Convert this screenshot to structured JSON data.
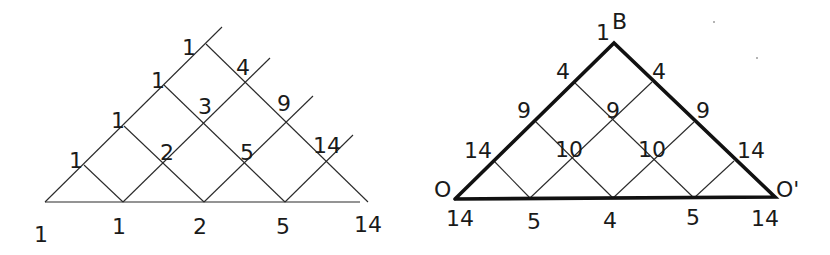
{
  "diagrams": [
    {
      "name": "left-lattice",
      "description": "Triangular lattice path counting (Catalan numbers)",
      "apex_label": "1",
      "left_edge_labels": [
        "1",
        "1",
        "1",
        "1"
      ],
      "interior_labels": [
        "2",
        "3"
      ],
      "right_edge_labels": [
        "4",
        "9",
        "14"
      ],
      "inner_right_labels": [
        "5"
      ],
      "baseline_labels": [
        "1",
        "1",
        "2",
        "5",
        "14"
      ],
      "labels": {
        "base_0": "1",
        "base_1": "1",
        "base_2": "2",
        "base_3": "5",
        "base_4": "14",
        "left_1": "1",
        "left_2": "1",
        "left_3": "1",
        "apex": "1",
        "mid_2": "2",
        "mid_3": "3",
        "mid_5": "5",
        "right_4": "4",
        "right_9": "9",
        "right_14": "14"
      }
    },
    {
      "name": "right-triangle",
      "description": "Bold triangle O-B-O' with path counts",
      "vertices": {
        "top": "B",
        "left": "O",
        "right": "O'"
      },
      "labels": {
        "apex_count": "1",
        "apex_letter": "B",
        "left_vertex": "O",
        "right_vertex": "O'",
        "left_4": "4",
        "left_9": "9",
        "left_14": "14",
        "right_4": "4",
        "right_9": "9",
        "right_14": "14",
        "center_9": "9",
        "mid_10a": "10",
        "mid_10b": "10",
        "base_14a": "14",
        "base_5a": "5",
        "base_4": "4",
        "base_5b": "5",
        "base_14b": "14"
      }
    }
  ]
}
